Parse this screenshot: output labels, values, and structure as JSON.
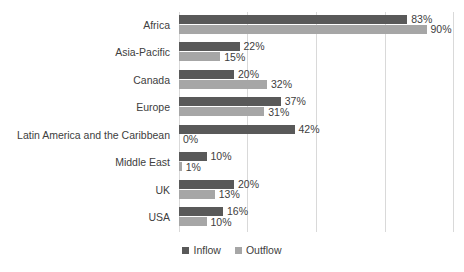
{
  "chart_data": {
    "type": "bar",
    "orientation": "horizontal",
    "title": "",
    "subtitle": "",
    "xlabel": "",
    "ylabel": "",
    "xlim": [
      0,
      100
    ],
    "grid": true,
    "gridline_values": [
      25,
      50,
      75,
      100
    ],
    "legend_position": "bottom",
    "categories": [
      "Africa",
      "Asia-Pacific",
      "Canada",
      "Europe",
      "Latin America and the Caribbean",
      "Middle East",
      "UK",
      "USA"
    ],
    "series": [
      {
        "name": "Inflow",
        "color": "#595959",
        "values": [
          83,
          22,
          20,
          37,
          42,
          10,
          20,
          16
        ],
        "labels": [
          "83%",
          "22%",
          "20%",
          "37%",
          "42%",
          "10%",
          "20%",
          "16%"
        ]
      },
      {
        "name": "Outflow",
        "color": "#a6a6a6",
        "values": [
          90,
          15,
          32,
          31,
          0,
          1,
          13,
          10
        ],
        "labels": [
          "90%",
          "15%",
          "32%",
          "31%",
          "0%",
          "1%",
          "13%",
          "10%"
        ]
      }
    ]
  },
  "legend": {
    "items": [
      {
        "label": "Inflow",
        "color": "#595959"
      },
      {
        "label": "Outflow",
        "color": "#a6a6a6"
      }
    ]
  },
  "colors": {
    "inflow": "#595959",
    "outflow": "#a6a6a6",
    "gridline": "#d9d9d9",
    "text": "#404040",
    "background": "#ffffff"
  }
}
